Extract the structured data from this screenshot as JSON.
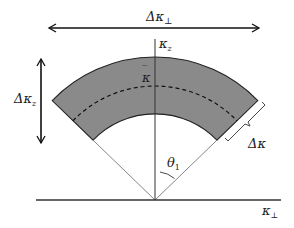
{
  "diagram": {
    "labels": {
      "delta_kappa_perp": "Δκ",
      "delta_kappa_perp_sub": "⊥",
      "kappa_z": "κ",
      "kappa_z_sub": "z",
      "kappa_bar": "κ",
      "kappa_bar_accent": "‾",
      "delta_kappa_z": "Δκ",
      "delta_kappa_z_sub": "z",
      "delta_kappa": "Δκ",
      "theta": "θ",
      "theta_sub": "1",
      "kappa_perp": "κ",
      "kappa_perp_sub": "⊥"
    },
    "colors": {
      "shell_fill": "#8a8a8a",
      "line": "#222222",
      "thin_line": "#555555"
    }
  }
}
